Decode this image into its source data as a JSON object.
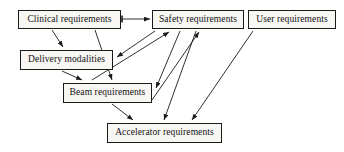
{
  "diagram": {
    "type": "directed-graph",
    "canvas": {
      "width": 344,
      "height": 152,
      "background": "#ffffff"
    },
    "style": {
      "node_fill": "#f7f6f3",
      "node_border": "#1a1a1a",
      "text_color": "#111111",
      "edge_color": "#1a1a1a"
    },
    "nodes": [
      {
        "id": "clinical",
        "label": "Clinical requirements",
        "x": 18,
        "y": 10,
        "w": 103,
        "h": 19
      },
      {
        "id": "safety",
        "label": "Safety requirements",
        "x": 152,
        "y": 10,
        "w": 92,
        "h": 19
      },
      {
        "id": "user",
        "label": "User requirements",
        "x": 248,
        "y": 10,
        "w": 88,
        "h": 19
      },
      {
        "id": "delivery",
        "label": "Delivery modalities",
        "x": 20,
        "y": 50,
        "w": 93,
        "h": 20
      },
      {
        "id": "beam",
        "label": "Beam requirements",
        "x": 63,
        "y": 83,
        "w": 89,
        "h": 20
      },
      {
        "id": "accelerator",
        "label": "Accelerator requirements",
        "x": 107,
        "y": 123,
        "w": 115,
        "h": 20
      }
    ],
    "edges": [
      {
        "id": "e1",
        "from": "clinical",
        "to": "safety",
        "label": ""
      },
      {
        "id": "e2",
        "from": "clinical",
        "to": "delivery",
        "label": ""
      },
      {
        "id": "e3",
        "from": "clinical",
        "to": "beam",
        "label": ""
      },
      {
        "id": "e4",
        "from": "safety",
        "to": "delivery",
        "label": ""
      },
      {
        "id": "e5",
        "from": "safety",
        "to": "beam",
        "label": ""
      },
      {
        "id": "e6",
        "from": "delivery",
        "to": "beam",
        "label": ""
      },
      {
        "id": "e7",
        "from": "delivery",
        "to": "safety",
        "label": ""
      },
      {
        "id": "e8",
        "from": "beam",
        "to": "safety",
        "label": ""
      },
      {
        "id": "e9",
        "from": "beam",
        "to": "accelerator",
        "label": ""
      },
      {
        "id": "e10",
        "from": "safety",
        "to": "accelerator",
        "label": ""
      },
      {
        "id": "e11",
        "from": "user",
        "to": "accelerator",
        "label": ""
      }
    ]
  }
}
